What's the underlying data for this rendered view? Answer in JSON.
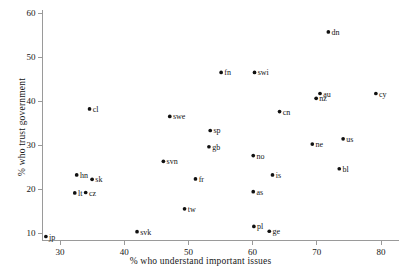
{
  "chart_data": {
    "type": "scatter",
    "title": "",
    "xlabel": "% who understand important issues",
    "ylabel": "% who trust government",
    "xlim": [
      27,
      81
    ],
    "ylim": [
      8,
      61
    ],
    "xticks": [
      30,
      40,
      50,
      60,
      70,
      80
    ],
    "yticks": [
      10,
      20,
      30,
      40,
      50,
      60
    ],
    "grid": false,
    "legend": "none",
    "points": [
      {
        "label": "jp",
        "x": 27.8,
        "y": 9.2,
        "lx": "right"
      },
      {
        "label": "lt",
        "x": 32.3,
        "y": 19.1,
        "lx": "right"
      },
      {
        "label": "cz",
        "x": 34.0,
        "y": 19.2,
        "lx": "right"
      },
      {
        "label": "hn",
        "x": 32.6,
        "y": 23.2,
        "lx": "right"
      },
      {
        "label": "sk",
        "x": 35.0,
        "y": 22.2,
        "lx": "right"
      },
      {
        "label": "cl",
        "x": 34.6,
        "y": 38.2,
        "lx": "right"
      },
      {
        "label": "svk",
        "x": 42.0,
        "y": 10.3,
        "lx": "right"
      },
      {
        "label": "svn",
        "x": 46.1,
        "y": 26.3,
        "lx": "right"
      },
      {
        "label": "swe",
        "x": 47.1,
        "y": 36.5,
        "lx": "right"
      },
      {
        "label": "tw",
        "x": 49.4,
        "y": 15.5,
        "lx": "right"
      },
      {
        "label": "fr",
        "x": 51.1,
        "y": 22.3,
        "lx": "right"
      },
      {
        "label": "gb",
        "x": 53.2,
        "y": 29.6,
        "lx": "right"
      },
      {
        "label": "sp",
        "x": 53.4,
        "y": 33.3,
        "lx": "right"
      },
      {
        "label": "fn",
        "x": 55.1,
        "y": 46.5,
        "lx": "right"
      },
      {
        "label": "as",
        "x": 60.1,
        "y": 19.4,
        "lx": "right"
      },
      {
        "label": "pl",
        "x": 60.2,
        "y": 11.5,
        "lx": "right"
      },
      {
        "label": "no",
        "x": 60.1,
        "y": 27.6,
        "lx": "right"
      },
      {
        "label": "swi",
        "x": 60.3,
        "y": 46.5,
        "lx": "right"
      },
      {
        "label": "ge",
        "x": 62.6,
        "y": 10.4,
        "lx": "right"
      },
      {
        "label": "is",
        "x": 63.1,
        "y": 23.2,
        "lx": "right"
      },
      {
        "label": "cn",
        "x": 64.2,
        "y": 37.6,
        "lx": "right"
      },
      {
        "label": "ne",
        "x": 69.3,
        "y": 30.2,
        "lx": "right"
      },
      {
        "label": "nz",
        "x": 69.9,
        "y": 40.6,
        "lx": "right"
      },
      {
        "label": "au",
        "x": 70.5,
        "y": 41.7,
        "lx": "right"
      },
      {
        "label": "dn",
        "x": 71.8,
        "y": 55.7,
        "lx": "right"
      },
      {
        "label": "bl",
        "x": 73.5,
        "y": 24.6,
        "lx": "right"
      },
      {
        "label": "us",
        "x": 74.1,
        "y": 31.4,
        "lx": "right"
      },
      {
        "label": "cy",
        "x": 79.2,
        "y": 41.7,
        "lx": "right"
      }
    ]
  }
}
